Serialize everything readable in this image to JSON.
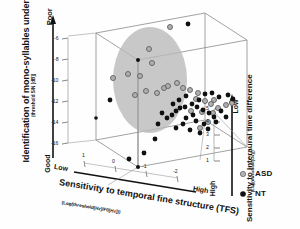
{
  "figure": {
    "background": "#ffffff",
    "box_line_color": "#7d7d7d",
    "axis_line_color": "#111111"
  },
  "legend": {
    "position": "bottom-right",
    "items": [
      {
        "label": "ASD",
        "marker": "gray-ring-circle",
        "color": "#9a9a9a"
      },
      {
        "label": "NT",
        "marker": "filled-circle",
        "color": "#101010"
      }
    ]
  },
  "ellipse": {
    "name": "asd-cluster-ellipse",
    "fill": "#b9b9b9",
    "opacity": 0.75
  },
  "chart_data": {
    "type": "scatter",
    "projection": "3d",
    "title": "",
    "xlabel": "Sensitivity to temporal fine structure (TFS)",
    "xlabel_sub": "(Log(threshold[Hz]/F0[Hz]))",
    "ylabel": "Identification of mono-syllables under noise",
    "ylabel_sub": "(threshold S/N [dB])",
    "zlabel": "Sensitivity to interaural time difference",
    "zlabel_sub": "(Log(threshold[us]))",
    "xticks": [
      "1",
      "0",
      "-1",
      "-2"
    ],
    "yticks": [
      "-6",
      "-8",
      "-10",
      "-12",
      "-14",
      "-16"
    ],
    "zticks": [
      "5",
      "4",
      "3",
      "2",
      "1"
    ],
    "xlim": [
      1,
      -2
    ],
    "ylim": [
      -17,
      -5
    ],
    "zlim": [
      5,
      0.5
    ],
    "grid": false,
    "x_anchor_low": "Low",
    "x_anchor_high": "High",
    "y_anchor_low": "Good",
    "y_anchor_high": "Poor",
    "z_anchor_low": "Low",
    "z_anchor_high": "High",
    "legend_position": "lower right",
    "series": [
      {
        "name": "ASD",
        "color": "#9a9a9a",
        "marker": "gray-ring-circle",
        "points_px": [
          [
            170,
            27
          ],
          [
            113,
            78
          ],
          [
            128,
            74
          ],
          [
            140,
            76
          ],
          [
            152,
            63
          ],
          [
            149,
            49
          ],
          [
            164,
            88
          ],
          [
            168,
            86
          ],
          [
            177,
            83
          ],
          [
            183,
            88
          ],
          [
            190,
            90
          ],
          [
            198,
            93
          ],
          [
            196,
            99
          ],
          [
            205,
            101
          ],
          [
            211,
            104
          ],
          [
            214,
            100
          ],
          [
            191,
            111
          ],
          [
            202,
            112
          ],
          [
            213,
            113
          ],
          [
            218,
            108
          ],
          [
            208,
            122
          ],
          [
            200,
            128
          ],
          [
            226,
            105
          ],
          [
            232,
            103
          ],
          [
            157,
            93
          ],
          [
            146,
            91
          ],
          [
            135,
            95
          ]
        ]
      },
      {
        "name": "NT",
        "color": "#101010",
        "marker": "filled-circle",
        "points_px": [
          [
            188,
            24
          ],
          [
            110,
            100
          ],
          [
            129,
            159
          ],
          [
            144,
            153
          ],
          [
            155,
            139
          ],
          [
            158,
            124
          ],
          [
            162,
            113
          ],
          [
            167,
            118
          ],
          [
            172,
            115
          ],
          [
            176,
            111
          ],
          [
            180,
            108
          ],
          [
            185,
            107
          ],
          [
            173,
            104
          ],
          [
            179,
            100
          ],
          [
            186,
            96
          ],
          [
            192,
            104
          ],
          [
            197,
            107
          ],
          [
            203,
            110
          ],
          [
            209,
            113
          ],
          [
            214,
            117
          ],
          [
            196,
            121
          ],
          [
            204,
            124
          ],
          [
            190,
            130
          ],
          [
            200,
            133
          ],
          [
            208,
            129
          ],
          [
            216,
            122
          ],
          [
            221,
            111
          ],
          [
            226,
            117
          ],
          [
            205,
            94
          ],
          [
            212,
            93
          ],
          [
            219,
            97
          ],
          [
            228,
            95
          ],
          [
            233,
            99
          ],
          [
            186,
            118
          ],
          [
            193,
            115
          ],
          [
            199,
            100
          ],
          [
            183,
            124
          ],
          [
            176,
            128
          ]
        ]
      }
    ]
  }
}
